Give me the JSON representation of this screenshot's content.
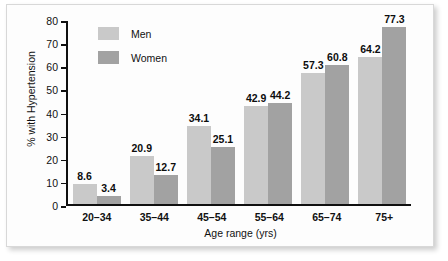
{
  "chart_data": {
    "type": "bar",
    "title": "",
    "xlabel": "Age range (yrs)",
    "ylabel": "% with Hypertension",
    "categories": [
      "20–34",
      "35–44",
      "45–54",
      "55–64",
      "65–74",
      "75+"
    ],
    "series": [
      {
        "name": "Men",
        "values": [
          8.6,
          20.9,
          34.1,
          42.9,
          57.3,
          64.2
        ],
        "color": "#c9c9c9"
      },
      {
        "name": "Women",
        "values": [
          3.4,
          12.7,
          25.1,
          44.2,
          60.8,
          77.3
        ],
        "color": "#a2a2a2"
      }
    ],
    "ylim": [
      0,
      80
    ],
    "yticks": [
      0,
      10,
      20,
      30,
      40,
      50,
      60,
      70,
      80
    ],
    "grid": false,
    "legend_position": "upper-left-inside"
  },
  "legend": {
    "items": [
      {
        "label": "Men"
      },
      {
        "label": "Women"
      }
    ]
  }
}
